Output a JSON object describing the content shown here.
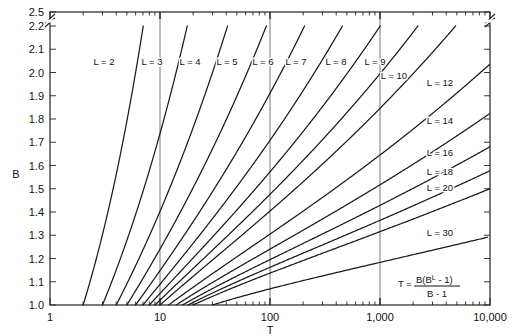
{
  "chart_data": {
    "type": "line",
    "title": "",
    "xlabel": "T",
    "ylabel": "B",
    "xscale": "log",
    "xlim": [
      1,
      10000
    ],
    "ylim": [
      1.0,
      2.2
    ],
    "y_break": true,
    "y_break_between": [
      2.2,
      2.5
    ],
    "grid": "vertical-only",
    "gridlines_x": [
      10,
      100,
      1000
    ],
    "x_tick_labels": [
      "1",
      "10",
      "100",
      "1,000",
      "10,000"
    ],
    "x_tick_values": [
      1,
      10,
      100,
      1000,
      10000
    ],
    "y_tick_labels": [
      "1.0",
      "1.1",
      "1.2",
      "1.3",
      "1.4",
      "1.5",
      "1.6",
      "1.7",
      "1.8",
      "1.9",
      "2.0",
      "2.1",
      "2.2",
      "2.5"
    ],
    "y_tick_values": [
      1.0,
      1.1,
      1.2,
      1.3,
      1.4,
      1.5,
      1.6,
      1.7,
      1.8,
      1.9,
      2.0,
      2.1,
      2.2,
      2.5
    ],
    "equation_text": "T = B(B^L - 1) / (B - 1)",
    "equation_parts": {
      "lhs": "T =",
      "numerator_pre": "B(B",
      "numerator_sup": "L",
      "numerator_post": " - 1)",
      "denominator": "B - 1"
    },
    "series": [
      {
        "name": "L = 2",
        "L": 2,
        "label": "L = 2",
        "label_x": 104,
        "label_y": 65
      },
      {
        "name": "L = 3",
        "L": 3,
        "label": "L = 3",
        "label_x": 152,
        "label_y": 65
      },
      {
        "name": "L = 4",
        "L": 4,
        "label": "L = 4",
        "label_x": 190,
        "label_y": 65
      },
      {
        "name": "L = 5",
        "L": 5,
        "label": "L = 5",
        "label_x": 227,
        "label_y": 65
      },
      {
        "name": "L = 6",
        "L": 6,
        "label": "L = 6",
        "label_x": 263,
        "label_y": 65
      },
      {
        "name": "L = 7",
        "L": 7,
        "label": "L = 7",
        "label_x": 296,
        "label_y": 65
      },
      {
        "name": "L = 8",
        "L": 8,
        "label": "L = 8",
        "label_x": 336,
        "label_y": 65
      },
      {
        "name": "L = 9",
        "L": 9,
        "label": "L = 9",
        "label_x": 375,
        "label_y": 65
      },
      {
        "name": "L = 10",
        "L": 10,
        "label": "L = 10",
        "label_x": 394,
        "label_y": 79
      },
      {
        "name": "L = 12",
        "L": 12,
        "label": "L = 12",
        "label_x": 440,
        "label_y": 86
      },
      {
        "name": "L = 14",
        "L": 14,
        "label": "L = 14",
        "label_x": 440,
        "label_y": 124
      },
      {
        "name": "L = 16",
        "L": 16,
        "label": "L = 16",
        "label_x": 440,
        "label_y": 156
      },
      {
        "name": "L = 18",
        "L": 18,
        "label": "L = 18",
        "label_x": 440,
        "label_y": 175
      },
      {
        "name": "L = 20",
        "L": 20,
        "label": "L = 20",
        "label_x": 440,
        "label_y": 191
      },
      {
        "name": "L = 30",
        "L": 30,
        "label": "L = 30",
        "label_x": 440,
        "label_y": 236
      }
    ]
  },
  "axis": {
    "x_title": "T",
    "y_title": "B"
  }
}
